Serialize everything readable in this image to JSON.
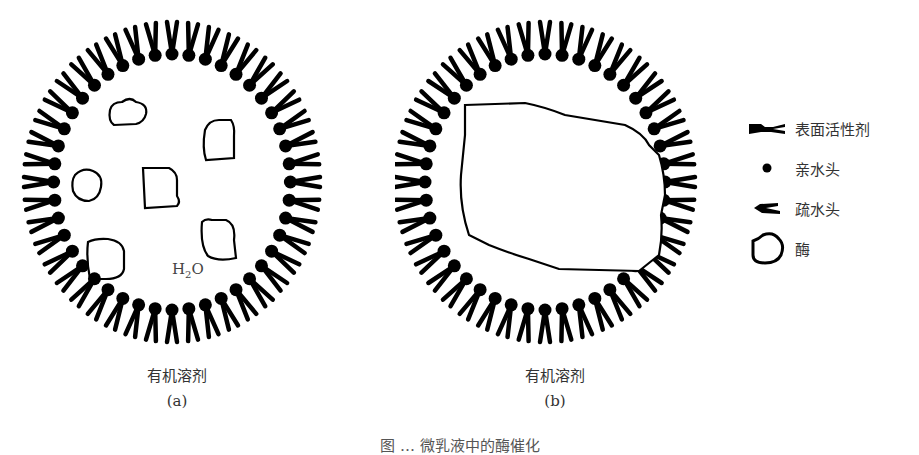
{
  "figure": {
    "panels": [
      {
        "id": "a",
        "solvent_label": "有机溶剂",
        "sublabel": "(a)",
        "inner_label": {
          "prefix": "H",
          "subscript": "2",
          "suffix": "O"
        },
        "enzyme_count": 6
      },
      {
        "id": "b",
        "solvent_label": "有机溶剂",
        "sublabel": "(b)",
        "enzyme_count": 1
      }
    ],
    "legend": [
      {
        "icon": "surfactant-icon",
        "label": "表面活性剂"
      },
      {
        "icon": "hydrophilic-head-icon",
        "label": "亲水头"
      },
      {
        "icon": "hydrophobic-tail-icon",
        "label": "疏水头"
      },
      {
        "icon": "enzyme-icon",
        "label": "酶"
      }
    ],
    "caption": "图 … 微乳液中的酶催化"
  },
  "colors": {
    "ink": "#000000",
    "text": "#333333",
    "background": "#ffffff"
  }
}
